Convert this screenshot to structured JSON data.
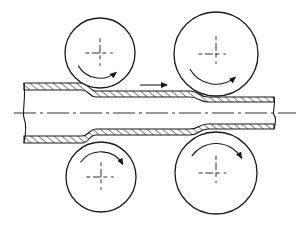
{
  "diagram": {
    "title": "Tube rolling with two pairs of rollers",
    "canvas": {
      "width": 302,
      "height": 226,
      "background": "#ffffff"
    },
    "colors": {
      "line": "#1a1a1a",
      "hatch": "#1a1a1a",
      "centerline": "#1a1a1a"
    },
    "centerline": {
      "y": 113,
      "x1": 14,
      "x2": 296,
      "dash": "22 4 3 4"
    },
    "tube": {
      "left_end_x": 24,
      "right_end_x": 274,
      "sections": [
        {
          "name": "entry",
          "x1": 24,
          "x2": 82,
          "upper_outer": 83,
          "upper_inner": 90,
          "lower_inner": 136,
          "lower_outer": 143
        },
        {
          "name": "middle",
          "x1": 96,
          "x2": 190,
          "upper_outer": 91,
          "upper_inner": 97,
          "lower_inner": 129,
          "lower_outer": 135
        },
        {
          "name": "exit",
          "x1": 208,
          "x2": 274,
          "upper_outer": 97,
          "upper_inner": 102,
          "lower_inner": 124,
          "lower_outer": 129
        }
      ]
    },
    "rollers": [
      {
        "id": "top-left",
        "cx": 100,
        "cy": 53,
        "r": 35,
        "rotation": "clockwise",
        "arrow_side": "bottom"
      },
      {
        "id": "top-right",
        "cx": 216,
        "cy": 54,
        "r": 42,
        "rotation": "clockwise",
        "arrow_side": "bottom"
      },
      {
        "id": "bottom-left",
        "cx": 101,
        "cy": 177,
        "r": 35,
        "rotation": "clockwise",
        "arrow_side": "top"
      },
      {
        "id": "bottom-right",
        "cx": 216,
        "cy": 173,
        "r": 41,
        "rotation": "clockwise",
        "arrow_side": "top"
      }
    ],
    "feed_arrow": {
      "x1": 140,
      "x2": 167,
      "y": 85,
      "direction": "right",
      "label": "Feed direction"
    }
  }
}
